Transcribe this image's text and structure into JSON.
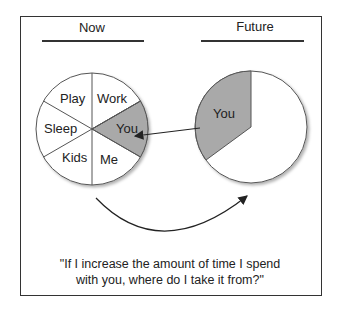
{
  "headings": {
    "now": "Now",
    "future": "Future"
  },
  "now_pie": {
    "slices": [
      {
        "label": "Work",
        "highlight": false
      },
      {
        "label": "You",
        "highlight": true
      },
      {
        "label": "Me",
        "highlight": false
      },
      {
        "label": "Kids",
        "highlight": false
      },
      {
        "label": "Sleep",
        "highlight": false
      },
      {
        "label": "Play",
        "highlight": false
      }
    ]
  },
  "future_pie": {
    "slices": [
      {
        "label": "You",
        "highlight": true
      },
      {
        "label": "",
        "highlight": false
      }
    ]
  },
  "caption": {
    "line1": "\"If I increase the amount of time I spend",
    "line2": "with you, where do I take it from?\""
  },
  "colors": {
    "highlight": "#a9a9a9",
    "line": "#333333",
    "background": "#ffffff"
  }
}
